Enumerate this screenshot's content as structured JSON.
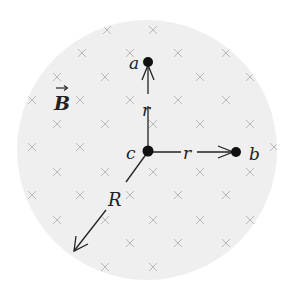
{
  "diagram": {
    "field_region": {
      "shape": "circle",
      "center": [
        147,
        150
      ],
      "radius": 130,
      "fill": "#efefef"
    },
    "field_label": "B",
    "field_label_has_vector_arrow": true,
    "field_direction": "into-page",
    "field_mark_symbol": "×",
    "field_mark_color": "#b9b9b9",
    "points": [
      {
        "id": "a",
        "label": "a",
        "x": 148,
        "y": 62
      },
      {
        "id": "b",
        "label": "b",
        "x": 236,
        "y": 152
      },
      {
        "id": "c",
        "label": "c",
        "x": 148,
        "y": 152
      }
    ],
    "vectors": [
      {
        "id": "r-to-a",
        "from": "c",
        "to": "a",
        "label": "r"
      },
      {
        "id": "r-to-b",
        "from": "c",
        "to": "b",
        "label": "r"
      },
      {
        "id": "R-radius",
        "from": "c",
        "to_xy": [
          73,
          252
        ],
        "label": "R"
      }
    ],
    "x_marks": [
      [
        107,
        30
      ],
      [
        153,
        30
      ],
      [
        82,
        53
      ],
      [
        130,
        53
      ],
      [
        178,
        53
      ],
      [
        226,
        53
      ],
      [
        57,
        77
      ],
      [
        105,
        77
      ],
      [
        200,
        77
      ],
      [
        250,
        77
      ],
      [
        32,
        100
      ],
      [
        80,
        100
      ],
      [
        130,
        100
      ],
      [
        178,
        100
      ],
      [
        226,
        100
      ],
      [
        57,
        124
      ],
      [
        105,
        124
      ],
      [
        153,
        124
      ],
      [
        200,
        124
      ],
      [
        250,
        124
      ],
      [
        32,
        147
      ],
      [
        80,
        147
      ],
      [
        274,
        147
      ],
      [
        57,
        172
      ],
      [
        105,
        172
      ],
      [
        153,
        172
      ],
      [
        200,
        172
      ],
      [
        250,
        172
      ],
      [
        32,
        195
      ],
      [
        80,
        195
      ],
      [
        130,
        195
      ],
      [
        178,
        195
      ],
      [
        226,
        195
      ],
      [
        57,
        220
      ],
      [
        105,
        220
      ],
      [
        153,
        220
      ],
      [
        200,
        220
      ],
      [
        250,
        220
      ],
      [
        130,
        243
      ],
      [
        178,
        243
      ],
      [
        226,
        243
      ],
      [
        105,
        267
      ],
      [
        153,
        267
      ]
    ]
  },
  "labels": {
    "a": "a",
    "b": "b",
    "c": "c",
    "r_vertical": "r",
    "r_horizontal": "r",
    "R": "R",
    "B": "B"
  }
}
